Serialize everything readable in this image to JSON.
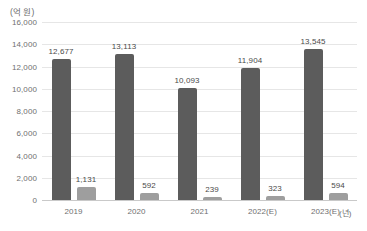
{
  "chart_data": {
    "type": "bar",
    "title": "",
    "subtitle": "",
    "xlabel": "(년)",
    "ylabel": "(억 원)",
    "categories": [
      "2019",
      "2020",
      "2021",
      "2022(E)",
      "2023(E)"
    ],
    "series": [
      {
        "name": "series-1",
        "color": "#5c5c5c",
        "values": [
          12677,
          13113,
          10093,
          11904,
          13545
        ],
        "labels": [
          "12,677",
          "13,113",
          "10,093",
          "11,904",
          "13,545"
        ]
      },
      {
        "name": "series-2",
        "color": "#9e9e9e",
        "values": [
          1131,
          592,
          239,
          323,
          594
        ],
        "labels": [
          "1,131",
          "592",
          "239",
          "323",
          "594"
        ]
      }
    ],
    "ylim": [
      0,
      16000
    ],
    "ytick_values": [
      0,
      2000,
      4000,
      6000,
      8000,
      10000,
      12000,
      14000,
      16000
    ],
    "ytick_labels": [
      "0",
      "2,000",
      "4,000",
      "6,000",
      "8,000",
      "10,000",
      "12,000",
      "14,000",
      "16,000"
    ],
    "grid": true,
    "legend": "none"
  }
}
